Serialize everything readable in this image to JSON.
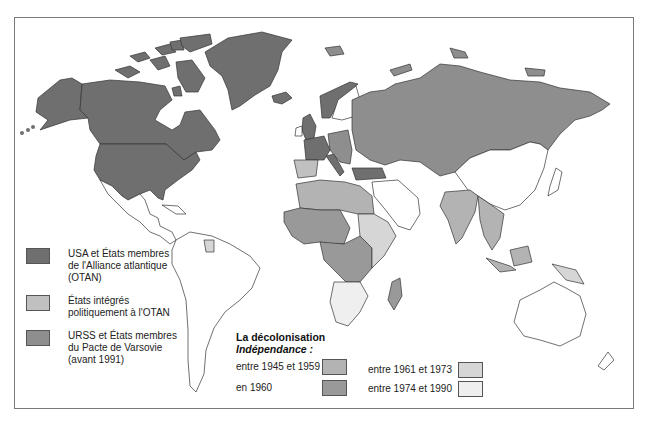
{
  "map": {
    "title": "Blocs de la guerre froide et décolonisation",
    "colors": {
      "nato": "#6f6f6f",
      "nato_integrated": "#c0c0c0",
      "ussr_warsaw": "#8e8e8e",
      "indep_1945_1959": "#b3b3b3",
      "indep_1960": "#999999",
      "indep_1961_1973": "#d6d6d6",
      "indep_1974_1990": "#efefef",
      "other": "#ffffff",
      "border": "#333333"
    }
  },
  "legend_blocs": {
    "items": [
      {
        "label": "USA et États membres de l'Alliance atlantique (OTAN)",
        "color": "#6f6f6f"
      },
      {
        "label": "États intégrés politiquement à l'OTAN",
        "color": "#c0c0c0"
      },
      {
        "label": "URSS et États membres du Pacte de Varsovie (avant 1991)",
        "color": "#8e8e8e"
      }
    ]
  },
  "legend_decolonisation": {
    "title": "La décolonisation",
    "subtitle": "Indépendance :",
    "items": [
      {
        "label": "entre 1945 et 1959",
        "color": "#b3b3b3"
      },
      {
        "label": "en 1960",
        "color": "#999999"
      },
      {
        "label": "entre 1961 et 1973",
        "color": "#d6d6d6"
      },
      {
        "label": "entre 1974 et 1990",
        "color": "#efefef"
      }
    ]
  }
}
